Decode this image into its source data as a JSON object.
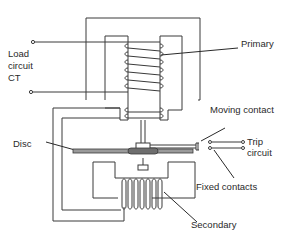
{
  "diagram": {
    "labels": {
      "load_line1": "Load",
      "load_line2": "circuit",
      "load_line3": "CT",
      "primary": "Primary",
      "moving_contact": "Moving contact",
      "trip_line1": "Trip",
      "trip_line2": "circuit",
      "disc": "Disc",
      "fixed_contacts": "Fixed contacts",
      "secondary": "Secondary"
    },
    "colors": {
      "line": "#3a3a3a",
      "text": "#2a2a2a",
      "disc_fill": "#9a9a9a",
      "background": "#ffffff"
    }
  }
}
